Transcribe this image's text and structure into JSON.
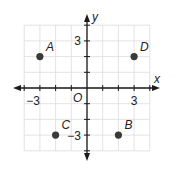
{
  "chart_data": {
    "type": "scatter",
    "title": "",
    "xlabel": "x",
    "ylabel": "y",
    "origin_label": "O",
    "xlim": [
      -4,
      4
    ],
    "ylim": [
      -4,
      4
    ],
    "grid": true,
    "x_tick_labels": [
      {
        "value": -3,
        "label": "−3"
      },
      {
        "value": 3,
        "label": "3"
      }
    ],
    "y_tick_labels": [
      {
        "value": 3,
        "label": "3"
      },
      {
        "value": -3,
        "label": "−3"
      }
    ],
    "points": [
      {
        "name": "A",
        "x": -3,
        "y": 2
      },
      {
        "name": "B",
        "x": 2,
        "y": -3
      },
      {
        "name": "C",
        "x": -2,
        "y": -3
      },
      {
        "name": "D",
        "x": 3,
        "y": 2
      }
    ],
    "colors": {
      "axis": "#1a1a1a",
      "grid": "#dcdcdc",
      "point": "#3a3a3a"
    }
  }
}
